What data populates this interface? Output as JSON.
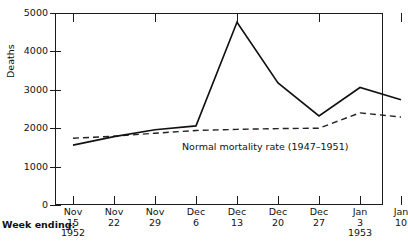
{
  "chart_data": {
    "type": "line",
    "title": "",
    "xlabel": "Week ending:",
    "ylabel": "Deaths",
    "ylim": [
      0,
      5000
    ],
    "yticks": [
      0,
      1000,
      2000,
      3000,
      4000,
      5000
    ],
    "ytick_labels": [
      "0",
      "1000",
      "2000",
      "3000",
      "4000",
      "5000"
    ],
    "grid": false,
    "legend": "annotation-inline",
    "categories": [
      "Nov 15 1952",
      "Nov 22",
      "Nov 29",
      "Dec 6",
      "Dec 13",
      "Dec 20",
      "Dec 27",
      "Jan 3 1953",
      "Jan 10"
    ],
    "xtick_labels": [
      {
        "month": "Nov",
        "day": "15",
        "year": "1952"
      },
      {
        "month": "Nov",
        "day": "22",
        "year": ""
      },
      {
        "month": "Nov",
        "day": "29",
        "year": ""
      },
      {
        "month": "Dec",
        "day": "6",
        "year": ""
      },
      {
        "month": "Dec",
        "day": "13",
        "year": ""
      },
      {
        "month": "Dec",
        "day": "20",
        "year": ""
      },
      {
        "month": "Dec",
        "day": "27",
        "year": ""
      },
      {
        "month": "Jan",
        "day": "3",
        "year": "1953"
      },
      {
        "month": "Jan",
        "day": "10",
        "year": ""
      }
    ],
    "series": [
      {
        "name": "Deaths",
        "style": "solid",
        "color": "#111111",
        "values": [
          1560,
          1780,
          1960,
          2060,
          4760,
          3180,
          2320,
          3060,
          2740
        ]
      },
      {
        "name": "Normal mortality rate (1947-1951)",
        "style": "dashed",
        "color": "#222222",
        "values": [
          1740,
          1790,
          1870,
          1940,
          1970,
          1990,
          2000,
          2400,
          2290
        ]
      }
    ],
    "annotations": [
      {
        "text": "Normal mortality rate (1947–1951)",
        "x": 4.2,
        "y": 1650
      }
    ]
  },
  "axes": {
    "y_title": "Deaths",
    "x_title": "Week ending:"
  }
}
